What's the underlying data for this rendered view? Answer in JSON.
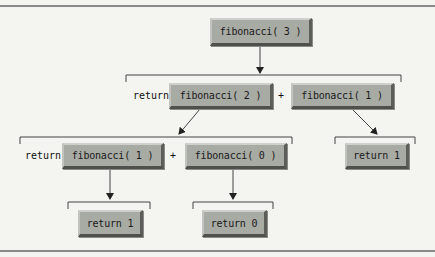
{
  "diagram": {
    "colors": {
      "node_fill": "#a8aaa4",
      "line": "#333333",
      "background": "#f4f4f1"
    },
    "nodes": [
      {
        "id": "fib3",
        "label": "fibonacci( 3 )"
      },
      {
        "id": "fib2",
        "label": "fibonacci( 2 )"
      },
      {
        "id": "fib1_top",
        "label": "fibonacci( 1 )"
      },
      {
        "id": "fib1_bottom",
        "label": "fibonacci( 1 )"
      },
      {
        "id": "fib0",
        "label": "fibonacci( 0 )"
      },
      {
        "id": "ret1_right",
        "label": "return 1"
      },
      {
        "id": "ret1_bottom",
        "label": "return 1"
      },
      {
        "id": "ret0_bottom",
        "label": "return 0"
      }
    ],
    "labels": {
      "return_row2": "return",
      "plus_row2": "+",
      "return_row3": "return",
      "plus_row3": "+"
    }
  }
}
